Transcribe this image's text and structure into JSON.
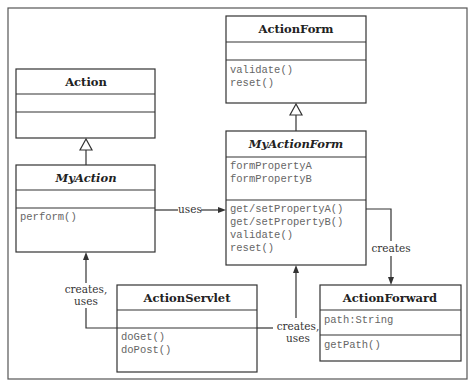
{
  "diagram": {
    "type": "UML class diagram",
    "classes": [
      {
        "id": "action",
        "name": "Action",
        "italic": false,
        "attributes": [],
        "operations": []
      },
      {
        "id": "myaction",
        "name": "MyAction",
        "italic": true,
        "attributes": [],
        "operations": [
          "perform()"
        ]
      },
      {
        "id": "actionform",
        "name": "ActionForm",
        "italic": false,
        "attributes": [],
        "operations": [
          "validate()",
          "reset()"
        ]
      },
      {
        "id": "myactionform",
        "name": "MyActionForm",
        "italic": true,
        "attributes": [
          "formPropertyA",
          "formPropertyB"
        ],
        "operations": [
          "get/setPropertyA()",
          "get/setPropertyB()",
          "validate()",
          "reset()"
        ]
      },
      {
        "id": "actionservlet",
        "name": "ActionServlet",
        "italic": false,
        "attributes": [],
        "operations": [
          "doGet()",
          "doPost()"
        ]
      },
      {
        "id": "actionforward",
        "name": "ActionForward",
        "italic": false,
        "attributes": [
          "path:String"
        ],
        "operations": [
          "getPath()"
        ]
      }
    ],
    "relations": [
      {
        "from": "MyAction",
        "to": "Action",
        "kind": "generalization",
        "label": ""
      },
      {
        "from": "MyActionForm",
        "to": "ActionForm",
        "kind": "generalization",
        "label": ""
      },
      {
        "from": "MyAction",
        "to": "MyActionForm",
        "kind": "association",
        "label": "uses"
      },
      {
        "from": "MyActionForm",
        "to": "ActionForward",
        "kind": "association",
        "label": "creates"
      },
      {
        "from": "ActionServlet",
        "to": "MyAction",
        "kind": "association",
        "label_line1": "creates,",
        "label_line2": "uses"
      },
      {
        "from": "ActionServlet",
        "to": "MyActionForm",
        "kind": "association",
        "label_line1": "creates,",
        "label_line2": "uses"
      }
    ]
  },
  "labels": {
    "uses": "uses",
    "creates": "creates",
    "creates_uses_left_1": "creates,",
    "creates_uses_left_2": "uses",
    "creates_uses_right_1": "creates,",
    "creates_uses_right_2": "uses"
  },
  "colors": {
    "line": "#333333",
    "member_text": "#666666",
    "title_text": "#222222",
    "frame": "#555555"
  }
}
